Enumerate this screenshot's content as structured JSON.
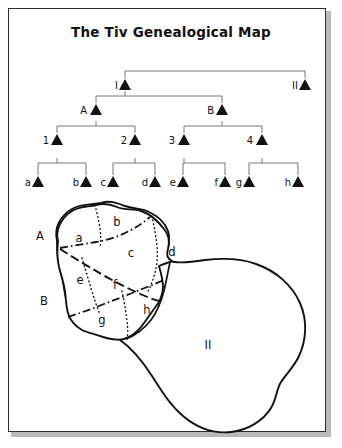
{
  "figure": {
    "title": "The Tiv Genealogical Map",
    "width": 342,
    "height": 448,
    "background_color": "#ffffff",
    "frame_color": "#2b2b2b",
    "ink_color": "#111111",
    "connector_color": "#777777"
  },
  "tree": {
    "symbol": "triangle",
    "levels": [
      {
        "level": 1,
        "nodes": [
          {
            "label": "I",
            "x": 125,
            "y": 88
          },
          {
            "label": "II",
            "x": 305,
            "y": 88
          }
        ]
      },
      {
        "level": 2,
        "nodes": [
          {
            "label": "A",
            "x": 96,
            "y": 113
          },
          {
            "label": "B",
            "x": 222,
            "y": 113
          }
        ]
      },
      {
        "level": 3,
        "nodes": [
          {
            "label": "1",
            "x": 57,
            "y": 143
          },
          {
            "label": "2",
            "x": 135,
            "y": 143
          },
          {
            "label": "3",
            "x": 184,
            "y": 143
          },
          {
            "label": "4",
            "x": 262,
            "y": 143
          }
        ]
      },
      {
        "level": 4,
        "nodes": [
          {
            "label": "a",
            "x": 38,
            "y": 185
          },
          {
            "label": "b",
            "x": 86,
            "y": 185
          },
          {
            "label": "c",
            "x": 113,
            "y": 185
          },
          {
            "label": "d",
            "x": 155,
            "y": 185
          },
          {
            "label": "e",
            "x": 183,
            "y": 185
          },
          {
            "label": "f",
            "x": 225,
            "y": 185
          },
          {
            "label": "g",
            "x": 249,
            "y": 185
          },
          {
            "label": "h",
            "x": 298,
            "y": 185
          }
        ]
      }
    ],
    "connections": [
      {
        "parent": "root",
        "children": [
          "I",
          "II"
        ]
      },
      {
        "parent": "I",
        "children": [
          "A",
          "B"
        ]
      },
      {
        "parent": "A",
        "children": [
          "1",
          "2"
        ]
      },
      {
        "parent": "B",
        "children": [
          "3",
          "4"
        ]
      },
      {
        "parent": "1",
        "children": [
          "a",
          "b"
        ]
      },
      {
        "parent": "2",
        "children": [
          "c",
          "d"
        ]
      },
      {
        "parent": "3",
        "children": [
          "e",
          "f"
        ]
      },
      {
        "parent": "4",
        "children": [
          "g",
          "h"
        ]
      }
    ]
  },
  "map": {
    "major_regions": [
      {
        "label": "A",
        "x": 40,
        "y": 236
      },
      {
        "label": "B",
        "x": 44,
        "y": 301
      },
      {
        "label": "II",
        "x": 208,
        "y": 345
      }
    ],
    "sub_regions": [
      {
        "label": "a",
        "x": 79,
        "y": 238
      },
      {
        "label": "b",
        "x": 117,
        "y": 222
      },
      {
        "label": "c",
        "x": 131,
        "y": 253
      },
      {
        "label": "d",
        "x": 170,
        "y": 252
      },
      {
        "label": "e",
        "x": 80,
        "y": 280
      },
      {
        "label": "f",
        "x": 115,
        "y": 285
      },
      {
        "label": "g",
        "x": 102,
        "y": 320
      },
      {
        "label": "h",
        "x": 147,
        "y": 310
      }
    ],
    "line_styles": {
      "coastline": "solid-thick",
      "major_division": "dash-dot",
      "second_division": "dashed",
      "minor_division": "dotted"
    }
  }
}
